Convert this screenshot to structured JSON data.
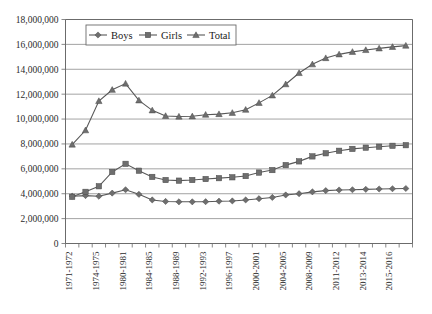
{
  "chart_data": {
    "type": "line",
    "title": "",
    "xlabel": "",
    "ylabel": "",
    "ylim": [
      0,
      18000000
    ],
    "ytick_step": 2000000,
    "grid": true,
    "legend_position": "top-left-inside",
    "ytick_labels": [
      "0",
      "2,000,000",
      "4,000,000",
      "6,000,000",
      "8,000,000",
      "10,000,000",
      "12,000,000",
      "14,000,000",
      "16,000,000",
      "18,000,000"
    ],
    "ytick_values": [
      0,
      2000000,
      4000000,
      6000000,
      8000000,
      10000000,
      12000000,
      14000000,
      16000000,
      18000000
    ],
    "categories": [
      "1971-1972",
      "1972-1973",
      "1974-1975",
      "1975-1976",
      "1980-1981",
      "1981-1982",
      "1984-1985",
      "1985-1986",
      "1988-1989",
      "1989-1990",
      "1992-1993",
      "1993-1994",
      "1996-1997",
      "1997-1998",
      "2000-2001",
      "2001-2002",
      "2004-2005",
      "2005-2006",
      "2008-2009",
      "2009-2010",
      "2011-2012",
      "2012-2013",
      "2013-2014",
      "2014-2015",
      "2015-2016",
      "2016-2017"
    ],
    "xtick_labels_visible": [
      "1971-1972",
      "1974-1975",
      "1980-1981",
      "1984-1985",
      "1988-1989",
      "1992-1993",
      "1996-1997",
      "2000-2001",
      "2004-2005",
      "2008-2009",
      "2011-2012",
      "2013-2014",
      "2015-2016"
    ],
    "series": [
      {
        "name": "Boys",
        "marker": "diamond",
        "color": "#6e6e6e",
        "values": [
          3800000,
          3850000,
          3800000,
          4050000,
          4320000,
          3950000,
          3500000,
          3380000,
          3350000,
          3350000,
          3360000,
          3400000,
          3420000,
          3500000,
          3600000,
          3700000,
          3900000,
          4000000,
          4150000,
          4250000,
          4300000,
          4320000,
          4350000,
          4380000,
          4400000,
          4420000
        ]
      },
      {
        "name": "Girls",
        "marker": "square",
        "color": "#6e6e6e",
        "values": [
          3750000,
          4150000,
          4600000,
          5750000,
          6400000,
          5850000,
          5350000,
          5100000,
          5050000,
          5100000,
          5180000,
          5250000,
          5320000,
          5420000,
          5700000,
          5900000,
          6300000,
          6600000,
          7000000,
          7250000,
          7450000,
          7600000,
          7700000,
          7780000,
          7850000,
          7900000
        ]
      },
      {
        "name": "Total",
        "marker": "triangle",
        "color": "#6e6e6e",
        "values": [
          7950000,
          9100000,
          11450000,
          12350000,
          12850000,
          11500000,
          10700000,
          10250000,
          10200000,
          10220000,
          10350000,
          10400000,
          10500000,
          10750000,
          11300000,
          11900000,
          12800000,
          13700000,
          14400000,
          14900000,
          15200000,
          15400000,
          15550000,
          15680000,
          15800000,
          15900000
        ]
      }
    ],
    "legend": [
      {
        "label": "Boys",
        "marker": "diamond"
      },
      {
        "label": "Girls",
        "marker": "square"
      },
      {
        "label": "Total",
        "marker": "triangle"
      }
    ]
  }
}
